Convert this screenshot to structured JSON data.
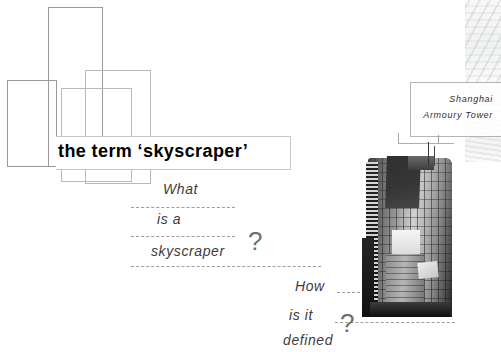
{
  "slide": {
    "title": "the term ‘skyscraper’",
    "background_color": "#ffffff",
    "title_color": "#000000",
    "rule_color": "#9d9d9d",
    "text_color": "#3c3c3c"
  },
  "questions": [
    {
      "id": "what-is-a-skyscraper",
      "words": [
        "What",
        "is a",
        "skyscraper"
      ],
      "mark": "?"
    },
    {
      "id": "how-is-it-defined",
      "words": [
        "How",
        "is it",
        "defined"
      ],
      "mark": "?"
    }
  ],
  "photo": {
    "caption_line_1": "Shanghai",
    "caption_line_2": "Armoury Tower",
    "alt": "grayscale photograph of a skyscraper tower"
  },
  "decor": {
    "rectangles": [
      {
        "name": "rect-tall-upper",
        "x": 48,
        "y": 7,
        "w": 53,
        "h": 158
      },
      {
        "name": "rect-left-wide",
        "x": 7,
        "y": 80,
        "w": 48,
        "h": 85
      },
      {
        "name": "rect-mid-right",
        "x": 85,
        "y": 70,
        "w": 64,
        "h": 112
      },
      {
        "name": "rect-inner-small",
        "x": 61,
        "y": 88,
        "w": 69,
        "h": 92
      }
    ]
  }
}
